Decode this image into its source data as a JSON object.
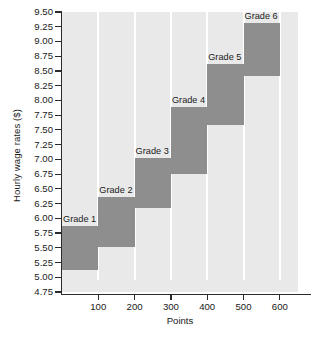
{
  "chart_data": {
    "type": "bar",
    "title": "",
    "xlabel": "Points",
    "ylabel": "Hourly wage rates ($)",
    "xlim": [
      0,
      650
    ],
    "ylim": [
      4.75,
      9.5
    ],
    "grid": true,
    "legend": "none",
    "orientation": "vertical",
    "bar_style": "floating-range-step",
    "x_ticks": [
      100,
      200,
      300,
      400,
      500,
      600
    ],
    "x_tick_labels": [
      "100",
      "200",
      "300",
      "400",
      "500",
      "600"
    ],
    "y_ticks": [
      4.75,
      5.0,
      5.25,
      5.5,
      5.75,
      6.0,
      6.25,
      6.5,
      6.75,
      7.0,
      7.25,
      7.5,
      7.75,
      8.0,
      8.25,
      8.5,
      8.75,
      9.0,
      9.25,
      9.5
    ],
    "y_tick_labels": [
      "4.75",
      "5.00",
      "5.25",
      "5.50",
      "5.75",
      "6.00",
      "6.25",
      "6.50",
      "6.75",
      "7.00",
      "7.25",
      "7.50",
      "7.75",
      "8.00",
      "8.25",
      "8.50",
      "8.75",
      "9.00",
      "9.25",
      "9.50"
    ],
    "categories": [
      "Grade 1",
      "Grade 2",
      "Grade 3",
      "Grade 4",
      "Grade 5",
      "Grade 6"
    ],
    "bars": [
      {
        "label": "Grade 1",
        "x_start": 0,
        "x_end": 100,
        "y_low": 5.12,
        "y_high": 5.87
      },
      {
        "label": "Grade 2",
        "x_start": 100,
        "x_end": 200,
        "y_low": 5.51,
        "y_high": 6.37
      },
      {
        "label": "Grade 3",
        "x_start": 200,
        "x_end": 300,
        "y_low": 6.17,
        "y_high": 7.02
      },
      {
        "label": "Grade 4",
        "x_start": 300,
        "x_end": 400,
        "y_low": 6.76,
        "y_high": 7.89
      },
      {
        "label": "Grade 5",
        "x_start": 400,
        "x_end": 500,
        "y_low": 7.58,
        "y_high": 8.62
      },
      {
        "label": "Grade 6",
        "x_start": 500,
        "x_end": 600,
        "y_low": 8.41,
        "y_high": 9.32
      }
    ],
    "colors": {
      "bar_fill": "#8e8e8e",
      "plot_background": "#e9e9e9",
      "gridline": "#ffffff",
      "axis": "#2b2b2b",
      "text": "#1a1a1a",
      "page_background": "#ffffff"
    }
  }
}
